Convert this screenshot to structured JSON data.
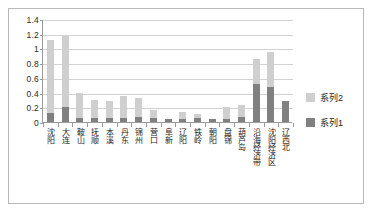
{
  "chart_data": {
    "type": "bar",
    "subtype": "stacked-column",
    "title": "",
    "xlabel": "",
    "ylabel": "",
    "ylim": [
      0,
      1.4
    ],
    "ytick_labels": [
      "1.4",
      "1.2",
      "1",
      "0.8",
      "0.6",
      "0.4",
      "0.2",
      "0"
    ],
    "ytick_values": [
      1.4,
      1.2,
      1.0,
      0.8,
      0.6,
      0.4,
      0.2,
      0
    ],
    "grid": true,
    "legend_position": "right",
    "categories": [
      "沈阳",
      "大连",
      "鞍山",
      "抚顺",
      "本溪",
      "丹东",
      "锦州",
      "营口",
      "阜新",
      "辽阳",
      "铁岭",
      "朝阳",
      "盘锦",
      "葫芦岛",
      "沿海经济带",
      "沈阳经济区",
      "辽西北"
    ],
    "series": [
      {
        "name": "系列1",
        "color": "#808080",
        "values": [
          0.12,
          0.2,
          0.06,
          0.05,
          0.05,
          0.05,
          0.07,
          0.05,
          0.04,
          0.04,
          0.05,
          0.04,
          0.04,
          0.07,
          0.51,
          0.48,
          0.29
        ]
      },
      {
        "name": "系列2",
        "color": "#cfcfcf",
        "values": [
          1.0,
          0.97,
          0.34,
          0.25,
          0.23,
          0.3,
          0.25,
          0.11,
          0.0,
          0.09,
          0.06,
          0.0,
          0.16,
          0.16,
          0.34,
          0.47,
          0.0
        ]
      }
    ],
    "totals": [
      1.12,
      1.17,
      0.4,
      0.3,
      0.28,
      0.35,
      0.32,
      0.16,
      0.04,
      0.13,
      0.11,
      0.04,
      0.2,
      0.23,
      0.85,
      0.95,
      0.29
    ]
  },
  "legend": {
    "entries": [
      {
        "label": "系列2",
        "swatch": "legend-swatch-series2"
      },
      {
        "label": "系列1",
        "swatch": "legend-swatch-series1"
      }
    ]
  },
  "colors": {
    "series1": "#808080",
    "series2": "#cfcfcf",
    "gridline": "#d2d2d2",
    "axis": "#9a9a9a",
    "frame_border": "#b9b9b9",
    "plot_background": "#ffffff"
  }
}
